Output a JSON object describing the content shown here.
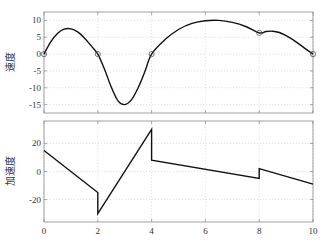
{
  "chart_data": [
    {
      "type": "line",
      "title": "",
      "xlabel": "",
      "ylabel": "速度",
      "xlim": [
        0,
        10
      ],
      "ylim": [
        -17.5,
        12.5
      ],
      "xticks": [
        0,
        2,
        4,
        6,
        8,
        10
      ],
      "yticks": [
        10,
        5,
        0,
        -5,
        -10,
        -15
      ],
      "ytick_labels": [
        "10",
        "5",
        "0",
        "-5",
        "-10",
        "-15"
      ],
      "grid": true,
      "series": [
        {
          "name": "velocity",
          "x": [
            0,
            0.25,
            0.5,
            0.75,
            1,
            1.25,
            1.5,
            1.75,
            2,
            2.25,
            2.5,
            2.75,
            3,
            3.25,
            3.5,
            3.75,
            4,
            4.5,
            5,
            5.5,
            6,
            6.5,
            7,
            7.5,
            8,
            8.25,
            8.5,
            8.75,
            9,
            9.25,
            9.5,
            9.75,
            10
          ],
          "y": [
            0,
            3.6,
            6.1,
            7.4,
            7.5,
            6.6,
            4.8,
            2.5,
            0,
            -4.5,
            -9.8,
            -13.9,
            -15,
            -13.6,
            -10,
            -5.2,
            0,
            4.3,
            7.3,
            9.1,
            9.9,
            10,
            9.4,
            8.2,
            6.3,
            6.7,
            6.8,
            6.4,
            5.5,
            4.3,
            2.9,
            1.4,
            0
          ]
        }
      ],
      "markers": {
        "x": [
          0,
          2,
          4,
          8,
          10
        ],
        "y": [
          0,
          0,
          0,
          6.3,
          0
        ],
        "style": "open-circle"
      }
    },
    {
      "type": "line",
      "title": "",
      "xlabel": "",
      "ylabel": "加速度",
      "xlim": [
        0,
        10
      ],
      "ylim": [
        -36,
        36
      ],
      "xticks": [
        0,
        2,
        4,
        6,
        8,
        10
      ],
      "xtick_labels": [
        "0",
        "2",
        "4",
        "6",
        "8",
        "10"
      ],
      "yticks": [
        20,
        0,
        -20
      ],
      "ytick_labels": [
        "20",
        "0",
        "-20"
      ],
      "grid": true,
      "series": [
        {
          "name": "acceleration",
          "x": [
            0,
            2,
            2,
            4,
            4,
            8,
            8,
            10
          ],
          "y": [
            15,
            -15,
            -30,
            30,
            8,
            -5,
            2,
            -9
          ]
        }
      ]
    }
  ],
  "labels": {
    "top_ylabel": "速度",
    "bottom_ylabel": "加速度"
  }
}
